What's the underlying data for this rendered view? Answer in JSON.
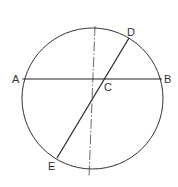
{
  "diagram": {
    "type": "geometry",
    "colors": {
      "stroke": "#333333",
      "background": "#ffffff"
    },
    "circle": {
      "cx": 92.5,
      "cy": 98.5,
      "r": 70.5
    },
    "points": {
      "A": {
        "label": "A",
        "x": 22.5,
        "y": 79
      },
      "B": {
        "label": "B",
        "x": 162,
        "y": 79
      },
      "C": {
        "label": "C",
        "x": 104,
        "y": 79
      },
      "D": {
        "label": "D",
        "x": 129,
        "y": 38
      },
      "E": {
        "label": "E",
        "x": 57,
        "y": 158
      }
    },
    "labels": {
      "A": "A",
      "B": "B",
      "C": "C",
      "D": "D",
      "E": "E"
    },
    "segments": [
      {
        "name": "chord-AB",
        "from": "A",
        "to": "B"
      },
      {
        "name": "chord-DE",
        "from": "D",
        "to": "E"
      }
    ],
    "center_line": {
      "style": "dash-dot",
      "x1": 95,
      "y1": 26,
      "x2": 89,
      "y2": 177
    }
  }
}
